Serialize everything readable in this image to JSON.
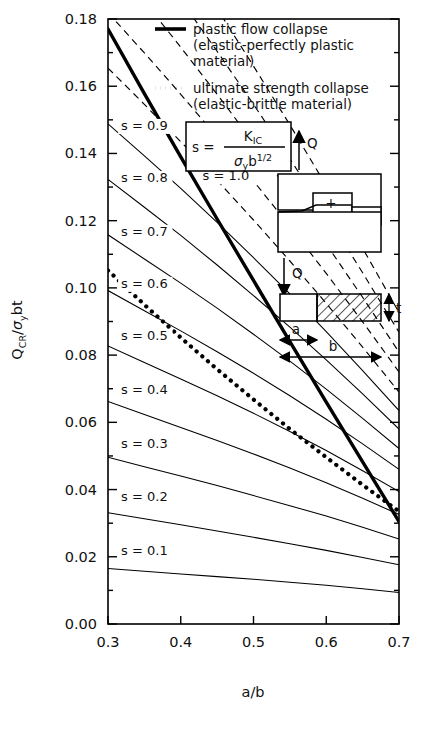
{
  "chart_data": {
    "type": "line",
    "title": "",
    "xlabel": "a/b",
    "ylabel": "Q_CR / σ_y bt",
    "xlim": [
      0.3,
      0.7
    ],
    "ylim": [
      0.0,
      0.18
    ],
    "xticks": [
      "0.3",
      "0.4",
      "0.5",
      "0.6",
      "0.7"
    ],
    "yticks": [
      "0.00",
      "0.02",
      "0.04",
      "0.06",
      "0.08",
      "0.10",
      "0.12",
      "0.14",
      "0.16",
      "0.18"
    ],
    "xtick_values": [
      0.3,
      0.4,
      0.5,
      0.6,
      0.7
    ],
    "ytick_values": [
      0.0,
      0.02,
      0.04,
      0.06,
      0.08,
      0.1,
      0.12,
      0.14,
      0.16,
      0.18
    ],
    "minor_ticks": true,
    "grid": false,
    "legend_position": "top-right-inside",
    "x": [
      0.3,
      0.35,
      0.4,
      0.45,
      0.5,
      0.55,
      0.6,
      0.65,
      0.7
    ],
    "series": [
      {
        "name": "s = 0.1",
        "label": "s = 0.1",
        "style": "solid-thin",
        "label_x": 0.318,
        "label_y": 0.0205,
        "values": [
          0.0165,
          0.0157,
          0.0149,
          0.0141,
          0.0133,
          0.0124,
          0.0115,
          0.0105,
          0.0094
        ]
      },
      {
        "name": "s = 0.2",
        "label": "s = 0.2",
        "style": "solid-thin",
        "label_x": 0.318,
        "label_y": 0.0365,
        "values": [
          0.0331,
          0.0313,
          0.0295,
          0.0277,
          0.0258,
          0.0239,
          0.0219,
          0.0198,
          0.0176
        ]
      },
      {
        "name": "s = 0.3",
        "label": "s = 0.3",
        "style": "solid-thin",
        "label_x": 0.318,
        "label_y": 0.0525,
        "values": [
          0.0496,
          0.0468,
          0.044,
          0.0412,
          0.0382,
          0.0352,
          0.0321,
          0.0288,
          0.0253
        ]
      },
      {
        "name": "s = 0.4",
        "label": "s = 0.4",
        "style": "solid-thin",
        "label_x": 0.318,
        "label_y": 0.0685,
        "values": [
          0.0662,
          0.0623,
          0.0585,
          0.0546,
          0.0506,
          0.0464,
          0.042,
          0.0374,
          0.0326
        ]
      },
      {
        "name": "s = 0.5",
        "label": "s = 0.5",
        "style": "solid-thin",
        "label_x": 0.318,
        "label_y": 0.0845,
        "values": [
          0.0827,
          0.0778,
          0.0729,
          0.0679,
          0.0627,
          0.0573,
          0.0516,
          0.0456,
          0.0394
        ]
      },
      {
        "name": "s = 0.6",
        "label": "s = 0.6",
        "style": "solid-thin",
        "label_x": 0.318,
        "label_y": 0.1,
        "values": [
          0.0992,
          0.0932,
          0.0872,
          0.081,
          0.0746,
          0.0679,
          0.0609,
          0.0536,
          0.046
        ]
      },
      {
        "name": "s = 0.7",
        "label": "s = 0.7",
        "style": "solid-thin",
        "label_x": 0.318,
        "label_y": 0.1155,
        "values": [
          0.1158,
          0.1086,
          0.1014,
          0.094,
          0.0862,
          0.0782,
          0.0699,
          0.0612,
          0.0522
        ]
      },
      {
        "name": "s = 0.8",
        "label": "s = 0.8",
        "style": "solid-thin",
        "label_x": 0.318,
        "label_y": 0.1315,
        "values": [
          0.1323,
          0.124,
          0.1156,
          0.1068,
          0.0977,
          0.0883,
          0.0786,
          0.0685,
          0.058
        ]
      },
      {
        "name": "s = 0.9",
        "label": "s = 0.9",
        "style": "solid-thin",
        "label_x": 0.318,
        "label_y": 0.147,
        "values": [
          0.1488,
          0.1393,
          0.1296,
          0.1195,
          0.109,
          0.0982,
          0.087,
          0.0754,
          0.0635
        ]
      },
      {
        "name": "s = 1.0",
        "label": "s = 1.0",
        "style": "dashed",
        "label_x": 0.43,
        "label_y": 0.132,
        "values": [
          0.1654,
          0.1546,
          0.1435,
          0.132,
          0.1202,
          0.108,
          0.0954,
          0.0824,
          0.069
        ]
      },
      {
        "name": "s = 1.1",
        "label": "",
        "style": "dashed",
        "label_x": null,
        "label_y": null,
        "values": [
          0.1819,
          0.1699,
          0.1576,
          0.1449,
          0.1318,
          0.1183,
          0.1043,
          0.0899,
          0.075
        ]
      },
      {
        "name": "s = 1.2",
        "label": "",
        "style": "dashed",
        "label_x": null,
        "label_y": null,
        "values": [
          0.1984,
          0.1852,
          0.1716,
          0.1576,
          0.1432,
          0.1283,
          0.113,
          0.0972,
          0.0809
        ]
      },
      {
        "name": "s = 1.3",
        "label": "",
        "style": "dashed",
        "label_x": null,
        "label_y": null,
        "values": [
          0.215,
          0.2005,
          0.1857,
          0.1704,
          0.1546,
          0.1384,
          0.1217,
          0.1045,
          0.0868
        ]
      },
      {
        "name": "s = 1.4",
        "label": "",
        "style": "dashed",
        "label_x": null,
        "label_y": null,
        "values": [
          0.2315,
          0.2158,
          0.1997,
          0.1831,
          0.166,
          0.1485,
          0.1304,
          0.1118,
          0.0927
        ]
      },
      {
        "name": "plastic flow collapse",
        "label": "",
        "style": "solid-thick",
        "label_x": null,
        "label_y": null,
        "values": [
          0.177,
          0.1578,
          0.139,
          0.1205,
          0.1022,
          0.084,
          0.066,
          0.0482,
          0.0305
        ]
      },
      {
        "name": "ultimate strength collapse",
        "label": "",
        "style": "dotted",
        "label_x": null,
        "label_y": null,
        "values": [
          0.1052,
          0.095,
          0.0852,
          0.0758,
          0.0668,
          0.058,
          0.0496,
          0.0414,
          0.0335
        ]
      }
    ]
  },
  "legend": {
    "entries": [
      {
        "marker": "solid-line",
        "line1": "plastic flow collapse",
        "line2": "(elastic-perfectly plastic",
        "line3": "material)"
      },
      {
        "marker": "dotted-line",
        "line1": "ultimate strength collapse",
        "line2": "(elastic-brittle material)",
        "line3": ""
      }
    ]
  },
  "formula_box": {
    "lhs": "s =",
    "numerator": "K",
    "numerator_sub": "IC",
    "denominator_sigma": "σ",
    "denominator_sigma_sub": "y",
    "denominator_b": "b",
    "denominator_b_sup": "1/2"
  },
  "inset": {
    "load_top_label": "Q",
    "load_bottom_label": "Q",
    "moment_plus": "+",
    "moment_minus": "–",
    "dim_a": "a",
    "dim_b": "b",
    "dim_t": "t"
  },
  "axis": {
    "x_title": "a/b",
    "y_title_main": "Q",
    "y_title_main_sub": "CR",
    "y_title_slash": "/",
    "y_title_sigma": "σ",
    "y_title_sigma_sub": "y",
    "y_title_bt": "bt"
  },
  "colors": {
    "ink": "#000000",
    "background": "#ffffff"
  }
}
